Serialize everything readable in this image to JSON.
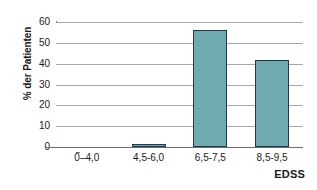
{
  "chart_data": {
    "type": "bar",
    "title": "",
    "subtitle": "",
    "categories": [
      "0–4,0",
      "4,5-6,0",
      "6,5-7,5",
      "8,5-9,5"
    ],
    "values": [
      0,
      1,
      56,
      42
    ],
    "xlabel": "EDSS",
    "ylabel": "% der Patienten",
    "ylim": [
      0,
      60
    ],
    "yticks": [
      0,
      10,
      20,
      30,
      40,
      50,
      60
    ],
    "ytick_labels": [
      "0",
      "10",
      "20",
      "30",
      "40",
      "50",
      "60"
    ],
    "grid": true,
    "grid_axis": "y",
    "legend": false,
    "legend_position": "none",
    "bar_fill_color": "#6faab0",
    "bar_border_color": "#1d3b4a",
    "gridline_color": "#a8a8a8",
    "axis_color": "#6e6e6e",
    "background_color": "#ffffff",
    "annotations": []
  }
}
